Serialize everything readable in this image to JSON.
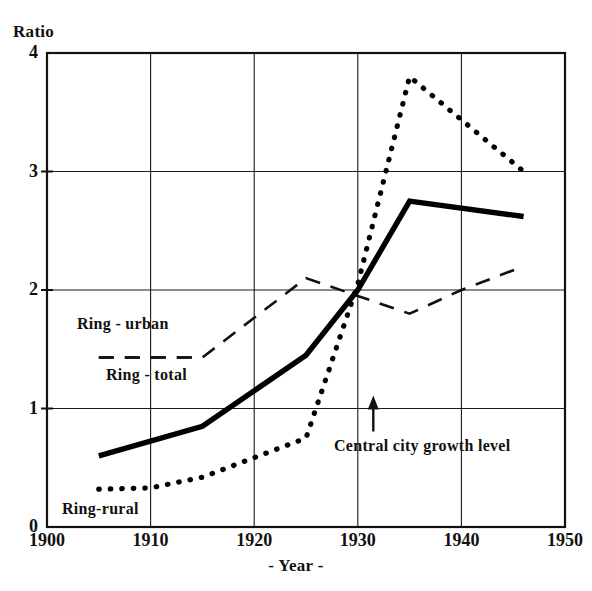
{
  "chart_data": {
    "type": "line",
    "title": "",
    "ylabel": "Ratio",
    "xlabel": "- Year -",
    "xlim": [
      1900,
      1950
    ],
    "ylim": [
      0,
      4
    ],
    "xticks": [
      1900,
      1910,
      1920,
      1930,
      1940,
      1950
    ],
    "yticks": [
      0,
      1,
      2,
      3,
      4
    ],
    "grid": true,
    "legend_position": "inline-labels",
    "series": [
      {
        "name": "Ring - total",
        "style": "solid",
        "linewidth": 4,
        "color": "#000000",
        "x": [
          1905,
          1915,
          1925,
          1930,
          1935,
          1946
        ],
        "values": [
          0.6,
          0.85,
          1.45,
          2.0,
          2.75,
          2.62
        ]
      },
      {
        "name": "Ring - urban",
        "style": "dashed",
        "linewidth": 2,
        "color": "#000000",
        "x": [
          1905,
          1915,
          1925,
          1930,
          1935,
          1940,
          1946
        ],
        "values": [
          1.43,
          1.43,
          2.1,
          1.95,
          1.8,
          2.0,
          2.2
        ]
      },
      {
        "name": "Ring-rural",
        "style": "dotted",
        "linewidth": 4,
        "color": "#000000",
        "x": [
          1905,
          1910,
          1915,
          1925,
          1930,
          1935,
          1946
        ],
        "values": [
          0.32,
          0.33,
          0.42,
          0.75,
          2.05,
          3.8,
          3.0
        ]
      }
    ],
    "annotations": [
      {
        "text": "Central city growth level",
        "arrow": "up-arrow",
        "x": 1931.5,
        "y": 1.0
      }
    ]
  },
  "axis": {
    "y_title": "Ratio",
    "x_title": "- Year -",
    "y_tick_labels": [
      "4",
      "3",
      "2",
      "1",
      "0"
    ],
    "x_tick_labels": [
      "1900",
      "1910",
      "1920",
      "1930",
      "1940",
      "1950"
    ]
  },
  "series_labels": {
    "ring_urban": "Ring - urban",
    "ring_total": "Ring - total",
    "ring_rural": "Ring-rural"
  },
  "annotation": {
    "central_city": "Central city growth level"
  }
}
